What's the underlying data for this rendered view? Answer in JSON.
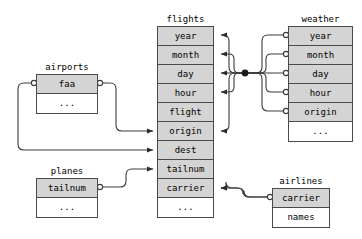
{
  "diagram": {
    "type": "entity-relationship-diagram",
    "colors": {
      "key_field_fill": "#d4d4d4",
      "plain_field_fill": "#ffffff",
      "border": "#4a4a4a",
      "connector": "#3a3a3a",
      "background": "#ffffff"
    },
    "ellipsis_label": "...",
    "entities": [
      {
        "name": "flights",
        "label": "flights",
        "x": 157,
        "y": 26,
        "w": 57,
        "title_y": 14,
        "row_h": 19,
        "fields": [
          {
            "label": "year",
            "key": true
          },
          {
            "label": "month",
            "key": true
          },
          {
            "label": "day",
            "key": true
          },
          {
            "label": "hour",
            "key": true
          },
          {
            "label": "flight",
            "key": true
          },
          {
            "label": "origin",
            "key": true
          },
          {
            "label": "dest",
            "key": true
          },
          {
            "label": "tailnum",
            "key": true
          },
          {
            "label": "carrier",
            "key": true
          },
          {
            "label": "...",
            "key": false
          }
        ]
      },
      {
        "name": "weather",
        "label": "weather",
        "x": 288,
        "y": 26,
        "w": 65,
        "title_y": 14,
        "row_h": 19,
        "fields": [
          {
            "label": "year",
            "key": true
          },
          {
            "label": "month",
            "key": true
          },
          {
            "label": "day",
            "key": true
          },
          {
            "label": "hour",
            "key": true
          },
          {
            "label": "origin",
            "key": true
          },
          {
            "label": "...",
            "key": false
          }
        ]
      },
      {
        "name": "airports",
        "label": "airports",
        "x": 36,
        "y": 74,
        "w": 62,
        "title_y": 62,
        "row_h": 19,
        "fields": [
          {
            "label": "faa",
            "key": true
          },
          {
            "label": "...",
            "key": false
          }
        ]
      },
      {
        "name": "planes",
        "label": "planes",
        "x": 36,
        "y": 178,
        "w": 62,
        "title_y": 166,
        "row_h": 19,
        "fields": [
          {
            "label": "tailnum",
            "key": true
          },
          {
            "label": "...",
            "key": false
          }
        ]
      },
      {
        "name": "airlines",
        "label": "airlines",
        "x": 272,
        "y": 188,
        "w": 58,
        "title_y": 176,
        "row_h": 19,
        "fields": [
          {
            "label": "carrier",
            "key": true
          },
          {
            "label": "names",
            "key": false
          }
        ]
      }
    ],
    "relationships": [
      {
        "from": "weather.year",
        "to": "flights.year",
        "style": "circle-to-arrow"
      },
      {
        "from": "weather.month",
        "to": "flights.month",
        "style": "circle-to-arrow"
      },
      {
        "from": "weather.day",
        "to": "flights.day",
        "style": "circle-to-arrow"
      },
      {
        "from": "weather.hour",
        "to": "flights.hour",
        "style": "circle-to-arrow"
      },
      {
        "from": "weather.origin",
        "to": "flights.origin",
        "style": "circle-to-arrow"
      },
      {
        "from": "airports.faa",
        "to": "flights.origin",
        "style": "circle-to-arrow"
      },
      {
        "from": "airports.faa",
        "to": "flights.dest",
        "style": "circle-to-arrow"
      },
      {
        "from": "planes.tailnum",
        "to": "flights.tailnum",
        "style": "circle-to-arrow"
      },
      {
        "from": "airlines.carrier",
        "to": "flights.carrier",
        "style": "circle-to-arrow"
      }
    ]
  }
}
